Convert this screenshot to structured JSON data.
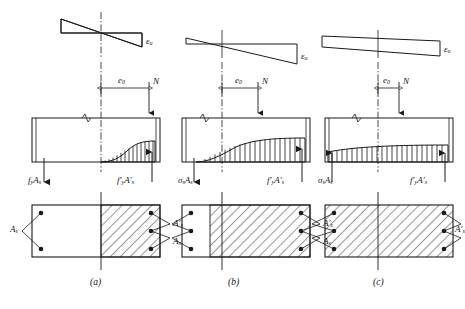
{
  "figure": {
    "stroke_color": "#1a1a1a",
    "hatch_color": "#1a1a1a",
    "background": "#ffffff"
  },
  "panels": [
    {
      "id": "a",
      "caption": "(a)",
      "strain_label": "ε",
      "strain_sub": "u",
      "strain_shape": "bowtie",
      "eccentricity_label": "e",
      "eccentricity_sub": "0",
      "eccentricity_size": "large",
      "axial_force_label": "N",
      "left_force_label": "f",
      "left_force_sub": "y",
      "left_force_label2": "A",
      "left_force_sub2": "s",
      "left_force_prime": false,
      "right_force_label": "f",
      "right_force_sub": "y",
      "right_force_label2": "A",
      "right_force_sub2": "s",
      "right_force_prime": true,
      "section_label_left": "A",
      "section_sub_left": "s",
      "section_label_right": "A",
      "section_sub_right": "s",
      "compression_zone_fraction": 0.5,
      "rebar_left_count": 2,
      "rebar_right_count": 3
    },
    {
      "id": "b",
      "caption": "(b)",
      "strain_label": "ε",
      "strain_sub": "u",
      "strain_shape": "small-bowtie",
      "eccentricity_label": "e",
      "eccentricity_sub": "0",
      "eccentricity_size": "medium",
      "axial_force_label": "N",
      "left_force_label": "σ",
      "left_force_sub": "s",
      "left_force_label2": "A",
      "left_force_sub2": "s",
      "left_force_prime": false,
      "right_force_label": "f",
      "right_force_sub": "y",
      "right_force_label2": "A",
      "right_force_sub2": "s",
      "right_force_prime": true,
      "section_label_left": "A",
      "section_sub_left": "s",
      "section_label_right": "A",
      "section_sub_right": "s",
      "compression_zone_fraction": 0.78,
      "rebar_left_count": 3,
      "rebar_right_count": 3
    },
    {
      "id": "c",
      "caption": "(c)",
      "strain_label": "ε",
      "strain_sub": "u",
      "strain_shape": "wedge",
      "eccentricity_label": "e",
      "eccentricity_sub": "0",
      "eccentricity_size": "small",
      "axial_force_label": "N",
      "left_force_label": "σ",
      "left_force_sub": "s",
      "left_force_label2": "A",
      "left_force_sub2": "s",
      "left_force_prime": false,
      "right_force_label": "f",
      "right_force_sub": "y",
      "right_force_label2": "A",
      "right_force_sub2": "s",
      "right_force_prime": true,
      "section_label_left": "A",
      "section_sub_left": "s",
      "section_label_right": "A",
      "section_sub_right": "s",
      "compression_zone_fraction": 1.0,
      "rebar_left_count": 3,
      "rebar_right_count": 3
    }
  ]
}
